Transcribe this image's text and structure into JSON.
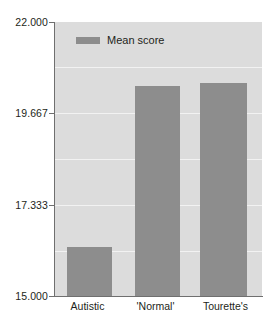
{
  "chart_data": {
    "type": "bar",
    "title": "",
    "xlabel": "",
    "ylabel": "",
    "categories": [
      "Autistic",
      "'Normal'",
      "Tourette's"
    ],
    "values": [
      16.25,
      20.37,
      20.44
    ],
    "series": [
      {
        "name": "Mean score",
        "values": [
          16.25,
          20.37,
          20.44
        ]
      }
    ],
    "ylim": [
      15.0,
      22.0
    ],
    "ytick_labels": [
      "22.000",
      "19.667",
      "17.333",
      "15.000"
    ],
    "ytick_values": [
      22.0,
      19.667,
      17.333,
      15.0
    ],
    "grid": true,
    "legend": {
      "position": "top-left-inside",
      "entries": [
        {
          "label": "Mean score",
          "color": "#8d8d8d"
        }
      ]
    },
    "colors": {
      "bar": "#8d8d8d",
      "plot_background": "#dcdcdc",
      "gridline": "#f2f2f2",
      "axis": "#6f6f6f",
      "text": "#231f20",
      "page_background": "#ffffff"
    }
  }
}
